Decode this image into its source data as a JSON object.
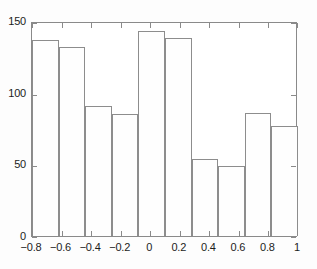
{
  "chart_data": {
    "type": "bar",
    "title": "",
    "subtitle": "",
    "xlabel": "",
    "ylabel": "",
    "legend": [],
    "grid": false,
    "legend_position": "none",
    "xlim": [
      -0.8,
      1.0
    ],
    "ylim": [
      0,
      150
    ],
    "bin_edges": [
      -0.8,
      -0.62,
      -0.44,
      -0.26,
      -0.08,
      0.1,
      0.28,
      0.46,
      0.64,
      0.82,
      1.0
    ],
    "bin_width": 0.18,
    "categories": [
      "-0.80 to -0.62",
      "-0.62 to -0.44",
      "-0.44 to -0.26",
      "-0.26 to -0.08",
      "-0.08 to 0.10",
      "0.10 to 0.28",
      "0.28 to 0.46",
      "0.46 to 0.64",
      "0.64 to 0.82",
      "0.82 to 1.00"
    ],
    "values": [
      137,
      132,
      91,
      85,
      143,
      138,
      54,
      49,
      86,
      77
    ],
    "xticks": [
      -0.8,
      -0.6,
      -0.4,
      -0.2,
      0,
      0.2,
      0.4,
      0.6,
      0.8,
      1
    ],
    "xticklabels": [
      "−0.8",
      "−0.6",
      "−0.4",
      "−0.2",
      "0",
      "0.2",
      "0.4",
      "0.6",
      "0.8",
      "1"
    ],
    "yticks": [
      0,
      50,
      100,
      150
    ],
    "yticklabels": [
      "0",
      "50",
      "100",
      "150"
    ],
    "colors": {
      "bar_face": "#fefefe",
      "bar_edge": "#8d8d8d",
      "axis": "#8a8a8a",
      "text": "#1c1c1c",
      "background": "#fdfdfd"
    }
  }
}
